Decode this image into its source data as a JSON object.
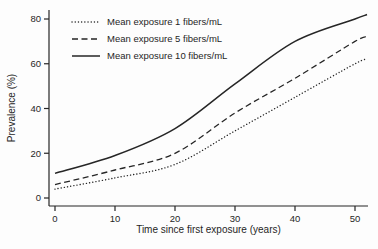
{
  "chart_data": {
    "type": "line",
    "title": "",
    "xlabel": "Time since first exposure (years)",
    "ylabel": "Prevalence (%)",
    "xlim": [
      0,
      50
    ],
    "ylim": [
      0,
      80
    ],
    "x_ticks": [
      0,
      10,
      20,
      30,
      40,
      50
    ],
    "y_ticks": [
      0,
      20,
      40,
      60,
      80
    ],
    "grid": false,
    "legend_position": "top-left-inside",
    "line_color": "#262626",
    "x": [
      0,
      10,
      20,
      30,
      40,
      50,
      52
    ],
    "series": [
      {
        "name": "Mean exposure 1 fibers/mL",
        "style": "dotted",
        "values": [
          4,
          9,
          15,
          30,
          45,
          60,
          62
        ]
      },
      {
        "name": "Mean exposure 5 fibers/mL",
        "style": "dashed",
        "values": [
          6,
          12.5,
          20,
          38,
          53.5,
          70,
          72
        ]
      },
      {
        "name": "Mean exposure 10 fibers/mL",
        "style": "solid",
        "values": [
          11,
          19,
          31,
          51,
          70,
          80,
          82
        ]
      }
    ]
  }
}
